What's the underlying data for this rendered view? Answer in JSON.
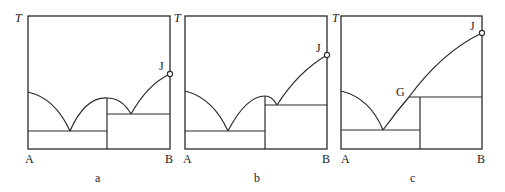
{
  "figure": {
    "panels": [
      {
        "id": "a",
        "caption": "a",
        "axis_label": "T",
        "left_label": "A",
        "right_label": "B",
        "point_labels": {
          "J": "J"
        }
      },
      {
        "id": "b",
        "caption": "b",
        "axis_label": "T",
        "left_label": "A",
        "right_label": "B",
        "point_labels": {
          "J": "J"
        }
      },
      {
        "id": "c",
        "caption": "c",
        "axis_label": "T",
        "left_label": "A",
        "right_label": "B",
        "point_labels": {
          "J": "J",
          "G": "G"
        }
      }
    ],
    "colors": {
      "stroke": "#2a2a2a",
      "background": "#ffffff"
    }
  }
}
